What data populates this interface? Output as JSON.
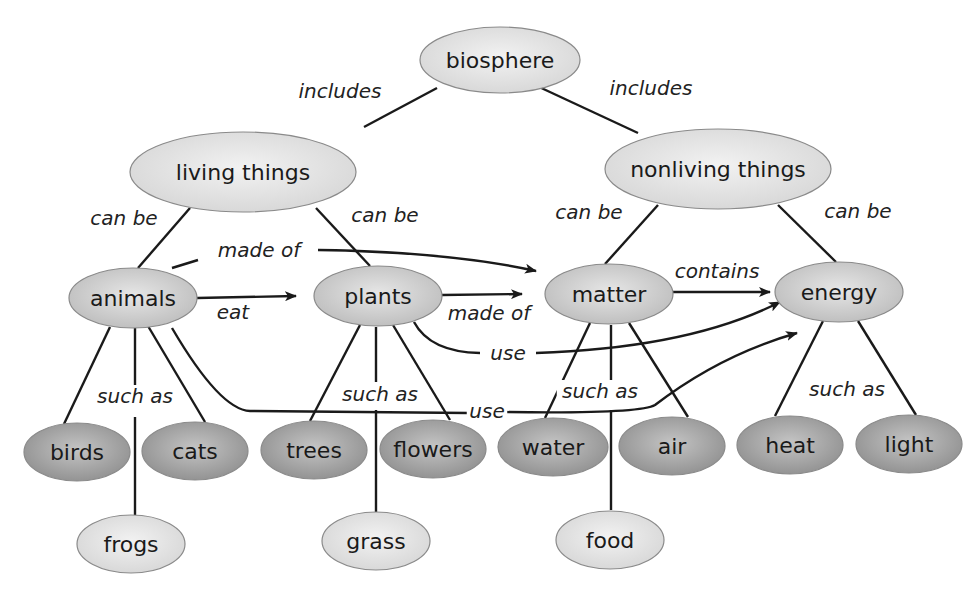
{
  "colors": {
    "level_light": "#e4e4e4",
    "level_mid": "#cfcfcf",
    "level_dark": "#a3a3a3",
    "line": "#1a1a1a"
  },
  "nodes": [
    {
      "id": "biosphere",
      "label": "biosphere",
      "cx": 500,
      "cy": 60,
      "rx": 80,
      "ry": 33,
      "shade": "light"
    },
    {
      "id": "living",
      "label": "living things",
      "cx": 243,
      "cy": 172,
      "rx": 113,
      "ry": 40,
      "shade": "light"
    },
    {
      "id": "nonliving",
      "label": "nonliving things",
      "cx": 718,
      "cy": 169,
      "rx": 113,
      "ry": 40,
      "shade": "light"
    },
    {
      "id": "animals",
      "label": "animals",
      "cx": 133,
      "cy": 298,
      "rx": 64,
      "ry": 30,
      "shade": "mid"
    },
    {
      "id": "plants",
      "label": "plants",
      "cx": 378,
      "cy": 296,
      "rx": 64,
      "ry": 30,
      "shade": "mid"
    },
    {
      "id": "matter",
      "label": "matter",
      "cx": 609,
      "cy": 294,
      "rx": 64,
      "ry": 30,
      "shade": "mid"
    },
    {
      "id": "energy",
      "label": "energy",
      "cx": 839,
      "cy": 292,
      "rx": 64,
      "ry": 30,
      "shade": "mid"
    },
    {
      "id": "birds",
      "label": "birds",
      "cx": 77,
      "cy": 452,
      "rx": 53,
      "ry": 29,
      "shade": "dark"
    },
    {
      "id": "cats",
      "label": "cats",
      "cx": 195,
      "cy": 451,
      "rx": 53,
      "ry": 29,
      "shade": "dark"
    },
    {
      "id": "trees",
      "label": "trees",
      "cx": 314,
      "cy": 450,
      "rx": 53,
      "ry": 29,
      "shade": "dark"
    },
    {
      "id": "flowers",
      "label": "flowers",
      "cx": 433,
      "cy": 449,
      "rx": 53,
      "ry": 29,
      "shade": "dark"
    },
    {
      "id": "water",
      "label": "water",
      "cx": 553,
      "cy": 447,
      "rx": 55,
      "ry": 29,
      "shade": "dark"
    },
    {
      "id": "air",
      "label": "air",
      "cx": 672,
      "cy": 446,
      "rx": 53,
      "ry": 29,
      "shade": "dark"
    },
    {
      "id": "heat",
      "label": "heat",
      "cx": 790,
      "cy": 445,
      "rx": 53,
      "ry": 29,
      "shade": "dark"
    },
    {
      "id": "light",
      "label": "light",
      "cx": 909,
      "cy": 444,
      "rx": 53,
      "ry": 29,
      "shade": "dark"
    },
    {
      "id": "frogs",
      "label": "frogs",
      "cx": 131,
      "cy": 544,
      "rx": 54,
      "ry": 29,
      "shade": "light"
    },
    {
      "id": "grass",
      "label": "grass",
      "cx": 376,
      "cy": 541,
      "rx": 54,
      "ry": 29,
      "shade": "light"
    },
    {
      "id": "food",
      "label": "food",
      "cx": 610,
      "cy": 540,
      "rx": 54,
      "ry": 29,
      "shade": "light"
    }
  ],
  "edges": [
    {
      "d": "M437,88 L364,127",
      "arrow": false
    },
    {
      "d": "M537,86 L638,133",
      "arrow": false
    },
    {
      "d": "M190,208 L138,268",
      "arrow": false
    },
    {
      "d": "M316,208 L370,266",
      "arrow": false
    },
    {
      "d": "M658,205 L605,264",
      "arrow": false
    },
    {
      "d": "M778,205 L836,262",
      "arrow": false
    },
    {
      "d": "M110,327 L64,424",
      "arrow": false
    },
    {
      "d": "M135,328 L135,395",
      "arrow": false
    },
    {
      "d": "M135,417 L135,515",
      "arrow": false
    },
    {
      "d": "M148,326 L205,422",
      "arrow": false
    },
    {
      "d": "M360,325 L310,421",
      "arrow": false
    },
    {
      "d": "M376,327 L376,382",
      "arrow": false
    },
    {
      "d": "M376,410 L376,512",
      "arrow": false
    },
    {
      "d": "M393,325 L450,420",
      "arrow": false
    },
    {
      "d": "M590,323 L545,418",
      "arrow": false
    },
    {
      "d": "M611,325 L611,383",
      "arrow": false
    },
    {
      "d": "M611,410 L611,510",
      "arrow": false
    },
    {
      "d": "M629,323 L688,417",
      "arrow": false
    },
    {
      "d": "M823,321 L775,416",
      "arrow": false
    },
    {
      "d": "M858,321 L916,415",
      "arrow": false
    },
    {
      "d": "M197,298 L296,296",
      "arrow": true
    },
    {
      "d": "M442,295 L522,294",
      "arrow": true
    },
    {
      "d": "M673,292 L770,292",
      "arrow": true
    },
    {
      "d": "M172,268 L198,260",
      "arrow": false
    },
    {
      "d": "M318,250 Q450,252 536,271",
      "arrow": true
    },
    {
      "d": "M414,322 Q430,352 480,353",
      "arrow": false
    },
    {
      "d": "M536,353 Q690,348 780,302",
      "arrow": true
    },
    {
      "d": "M172,328 Q220,410 250,411 L468,413",
      "arrow": false
    },
    {
      "d": "M504,412 Q640,414 655,405 Q720,355 797,333",
      "arrow": true
    }
  ],
  "link_labels": [
    {
      "text": "includes",
      "x": 340,
      "y": 91
    },
    {
      "text": "includes",
      "x": 651,
      "y": 88
    },
    {
      "text": "can be",
      "x": 124,
      "y": 218
    },
    {
      "text": "can be",
      "x": 385,
      "y": 215
    },
    {
      "text": "can be",
      "x": 589,
      "y": 212
    },
    {
      "text": "can be",
      "x": 858,
      "y": 211
    },
    {
      "text": "made of",
      "x": 259,
      "y": 250
    },
    {
      "text": "eat",
      "x": 233,
      "y": 312
    },
    {
      "text": "made of",
      "x": 489,
      "y": 313
    },
    {
      "text": "contains",
      "x": 717,
      "y": 271
    },
    {
      "text": "use",
      "x": 508,
      "y": 353
    },
    {
      "text": "use",
      "x": 487,
      "y": 411
    },
    {
      "text": "such as",
      "x": 135,
      "y": 396
    },
    {
      "text": "such as",
      "x": 380,
      "y": 394
    },
    {
      "text": "such as",
      "x": 600,
      "y": 391
    },
    {
      "text": "such as",
      "x": 847,
      "y": 389
    }
  ]
}
